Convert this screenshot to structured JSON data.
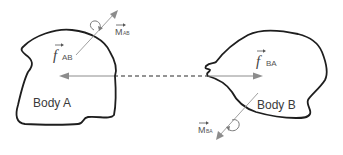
{
  "diagram": {
    "type": "free-body interaction diagram",
    "bodies": [
      {
        "id": "A",
        "label": "Body A"
      },
      {
        "id": "B",
        "label": "Body B"
      }
    ],
    "forces": [
      {
        "id": "f_AB",
        "symbol": "f",
        "subscript": "AB",
        "direction": "left, acting on Body A"
      },
      {
        "id": "f_BA",
        "symbol": "f",
        "subscript": "BA",
        "direction": "right, acting on Body B"
      }
    ],
    "moments": [
      {
        "id": "M_AB",
        "symbol": "M",
        "subscript": "AB",
        "direction": "up-right from Body A"
      },
      {
        "id": "M_BA",
        "symbol": "M",
        "subscript": "BA",
        "direction": "down-left from Body B"
      }
    ],
    "connector": {
      "style": "dashed",
      "between": [
        "A",
        "B"
      ]
    },
    "colors": {
      "outline": "#1e1e1e",
      "force_arrow": "#8c8c8c",
      "text": "#333333"
    }
  }
}
